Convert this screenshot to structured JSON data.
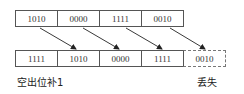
{
  "diagram": {
    "type": "shift-register",
    "top_row": {
      "cells": [
        "1010",
        "0000",
        "1111",
        "0010"
      ]
    },
    "bottom_row": {
      "cells": [
        "1111",
        "1010",
        "0000",
        "1111",
        "0010"
      ],
      "dashed_cell_index": 4
    },
    "arrows": [
      {
        "from": "top_row.0",
        "to": "bottom_row.1"
      },
      {
        "from": "top_row.1",
        "to": "bottom_row.2"
      },
      {
        "from": "top_row.2",
        "to": "bottom_row.3"
      },
      {
        "from": "top_row.3",
        "to": "bottom_row.4"
      }
    ],
    "labels": {
      "fill": "空出位补1",
      "lost": "丢失"
    },
    "colors": {
      "border": "#555555",
      "arrow": "#222222",
      "text": "#333333"
    }
  }
}
